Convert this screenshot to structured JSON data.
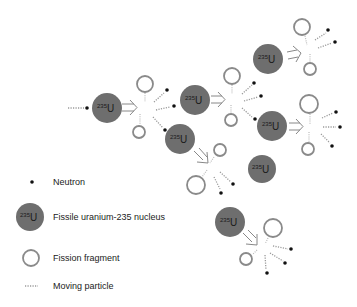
{
  "colors": {
    "nucleus_fill": "#6e6e6e",
    "fragment_stroke": "#8a8a8a",
    "neutron": "#111111",
    "trail": "#9a9a9a",
    "arrow": "#888888",
    "text": "#222222"
  },
  "nucleus_label": {
    "mass": "235",
    "symbol": "U"
  },
  "legend": {
    "neutron": "Neutron",
    "nucleus": "Fissile uranium-235 nucleus",
    "fragment": "Fission fragment",
    "moving": "Moving particle"
  }
}
